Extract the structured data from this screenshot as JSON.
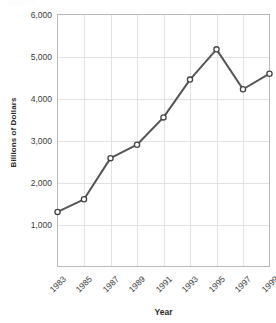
{
  "chart_data": {
    "type": "line",
    "title": "",
    "xlabel": "Year",
    "ylabel": "Billions of Dollars",
    "categories": [
      "1983",
      "1985",
      "1987",
      "1989",
      "1991",
      "1993",
      "1995",
      "1997",
      "1999"
    ],
    "x": [
      1983,
      1985,
      1987,
      1989,
      1991,
      1993,
      1995,
      1997,
      1999
    ],
    "values": [
      1300,
      1600,
      2580,
      2900,
      3550,
      4450,
      5170,
      4220,
      4590
    ],
    "series": [
      {
        "name": "Billions of Dollars",
        "values": [
          1300,
          1600,
          2580,
          2900,
          3550,
          4450,
          5170,
          4220,
          4590
        ]
      }
    ],
    "ylim": [
      0,
      6000
    ],
    "xlim": [
      1983,
      1999
    ],
    "yticks": [
      1000,
      2000,
      3000,
      4000,
      5000,
      6000
    ],
    "ytick_labels": [
      "1,000",
      "2,000",
      "3,000",
      "4,000",
      "5,000",
      "6,000"
    ],
    "xtick_labels": [
      "1983",
      "1985",
      "1987",
      "1989",
      "1991",
      "1993",
      "1995",
      "1997",
      "1999"
    ],
    "grid": true,
    "grid_axis": "both",
    "legend": false,
    "legend_position": "none",
    "marker": "open-circle",
    "xtick_label_rotation": -45,
    "colors": {
      "line": "#555555",
      "marker_face": "#ffffff",
      "marker_edge": "#444444",
      "grid": "#e2e2e2",
      "axis_frame": "#b9b9b9",
      "text": "#2b2b2b",
      "background": "#ffffff"
    }
  },
  "figure": {
    "cropped_header_text": "GRAPH"
  }
}
